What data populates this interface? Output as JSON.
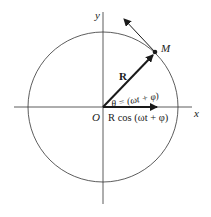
{
  "diagram": {
    "title": "",
    "labels": {
      "y_axis": "y",
      "x_axis": "x",
      "origin": "O",
      "point": "M",
      "vector": "R",
      "angle": "θ = (ωt + φ)",
      "projection": "R cos (ωt + φ)"
    },
    "colors": {
      "stroke": "#1a1a1a",
      "background": "#ffffff"
    }
  }
}
